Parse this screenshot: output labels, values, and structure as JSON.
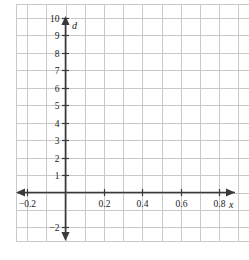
{
  "figure": {
    "background_color": "#ffffff",
    "grid_color": "#c9c9c9",
    "axis_color": "#3a3a3a",
    "text_color": "#1b1b1b",
    "x_axis_name": "x",
    "y_axis_name": "d"
  },
  "chart_data": {
    "type": "scatter",
    "title": "",
    "xlabel": "x",
    "ylabel": "d",
    "grid": true,
    "legend": null,
    "series": [],
    "x": [],
    "values": [],
    "xlim": [
      -0.26,
      1.1
    ],
    "ylim": [
      -2.8,
      10.8
    ],
    "x_tick_values": [
      -0.2,
      0.2,
      0.4,
      0.6,
      0.8,
      1.0
    ],
    "x_tick_labels": [
      "−0.2",
      "0.2",
      "0.4",
      "0.6",
      "0.8",
      "1.0"
    ],
    "y_tick_values": [
      10,
      9,
      8,
      7,
      6,
      5,
      4,
      3,
      2,
      1,
      -2
    ],
    "y_tick_labels": [
      "10",
      "9",
      "8",
      "7",
      "6",
      "5",
      "4",
      "3",
      "2",
      "1",
      "−2"
    ],
    "x_grid_positions": [
      -0.26,
      -0.2,
      -0.1,
      0.0,
      0.1,
      0.2,
      0.3,
      0.4,
      0.5,
      0.6,
      0.7,
      0.8,
      0.9,
      1.0,
      1.1
    ],
    "y_grid_positions": [
      10.8,
      10,
      9,
      8,
      7,
      6,
      5,
      4,
      3,
      2,
      1,
      0,
      -1,
      -2,
      -2.8
    ]
  }
}
